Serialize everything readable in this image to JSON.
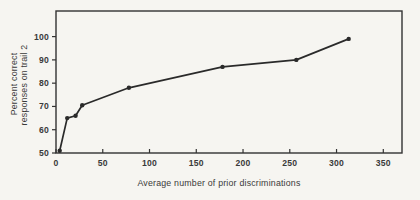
{
  "chart_data": {
    "type": "line",
    "title": "",
    "xlabel": "Average number of prior discriminations",
    "ylabel_lines": [
      "Percent correct",
      "responses on trail 2"
    ],
    "x": [
      4,
      12,
      21,
      28,
      78,
      178,
      257,
      313
    ],
    "y": [
      51,
      65,
      66,
      70.5,
      78,
      87,
      90,
      99
    ],
    "x_ticks": [
      0,
      50,
      100,
      150,
      200,
      250,
      300,
      350
    ],
    "y_ticks": [
      50,
      60,
      70,
      80,
      90,
      100
    ],
    "xlim": [
      0,
      370
    ],
    "ylim": [
      50,
      111
    ],
    "grid": false,
    "legend": "none",
    "marker": "filled-dot",
    "frame": "full-box",
    "colors": {
      "ink": "#2a2a2a",
      "frame": "#333333",
      "text": "#3a3a3a",
      "paper": "#f6f5f1"
    }
  }
}
